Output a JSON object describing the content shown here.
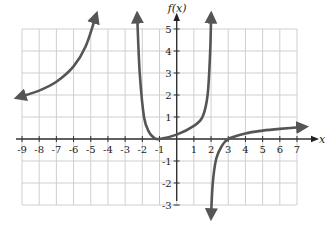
{
  "chart_data": {
    "type": "line",
    "title": "",
    "xlabel": "x",
    "ylabel": "f(x)",
    "xlim": [
      -9,
      7
    ],
    "ylim": [
      -3,
      5
    ],
    "grid": true,
    "x_ticks": [
      "-9",
      "-8",
      "-7",
      "-6",
      "-5",
      "-4",
      "-3",
      "-2",
      "-1",
      "1",
      "2",
      "3",
      "4",
      "5",
      "6",
      "7"
    ],
    "y_ticks": [
      "5",
      "4",
      "3",
      "2",
      "1",
      "-1",
      "-2",
      "-3"
    ],
    "vertical_asymptotes": [
      -2,
      2
    ],
    "series": [
      {
        "name": "left branch",
        "points": [
          [
            -9.2,
            1.9
          ],
          [
            -8,
            2.2
          ],
          [
            -7,
            2.6
          ],
          [
            -6,
            3.3
          ],
          [
            -5.3,
            4.2
          ],
          [
            -4.7,
            5.6
          ]
        ],
        "arrows": [
          "start",
          "end"
        ]
      },
      {
        "name": "middle branch",
        "points": [
          [
            -2.3,
            5.6
          ],
          [
            -2.15,
            3
          ],
          [
            -1.9,
            1
          ],
          [
            -1.6,
            0.3
          ],
          [
            -1.3,
            0.05
          ],
          [
            -1,
            0
          ],
          [
            0,
            0.2
          ],
          [
            1,
            0.6
          ],
          [
            1.5,
            1.0
          ],
          [
            1.8,
            2
          ],
          [
            1.95,
            4
          ],
          [
            2.0,
            5.6
          ]
        ],
        "arrows": [
          "start",
          "end"
        ]
      },
      {
        "name": "right branch",
        "points": [
          [
            2.0,
            -3.5
          ],
          [
            2.1,
            -2
          ],
          [
            2.3,
            -0.9
          ],
          [
            2.6,
            -0.35
          ],
          [
            3,
            0
          ],
          [
            4,
            0.25
          ],
          [
            5,
            0.38
          ],
          [
            6,
            0.46
          ],
          [
            7.4,
            0.55
          ]
        ],
        "arrows": [
          "start",
          "end"
        ]
      }
    ]
  },
  "labels": {
    "x_axis": "x",
    "y_axis": "f(x)"
  }
}
